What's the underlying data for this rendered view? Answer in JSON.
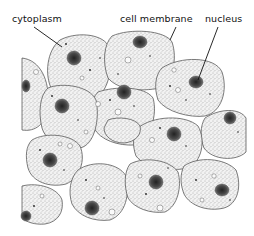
{
  "diagram": {
    "labels": [
      {
        "id": "cytoplasm",
        "text": "cytoplasm",
        "x": 12,
        "y": 13
      },
      {
        "id": "cell-membrane",
        "text": "cell membrane",
        "x": 120,
        "y": 13
      },
      {
        "id": "nucleus",
        "text": "nucleus",
        "x": 205,
        "y": 13
      }
    ],
    "colors": {
      "background": "#ffffff",
      "cell_fill": "#ececec",
      "cell_outline": "#555555",
      "nucleus": "#3a3a3a",
      "text": "#111111"
    }
  }
}
